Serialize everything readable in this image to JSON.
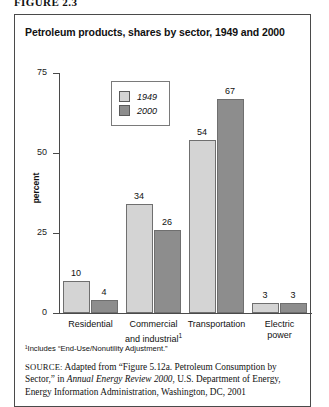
{
  "figure_label": "FIGURE 2.3",
  "chart_title": "Petroleum products, shares by sector, 1949 and 2000",
  "footnote": "¹Includes “End-Use/Nonutility Adjustment.”",
  "source": {
    "prefix": "SOURCE:",
    "part1": " Adapted from “Figure 5.12a. Petroleum Consumption by Sector,” in ",
    "italic": "Annual Energy Review 2000",
    "part2": ", U.S. Department of Energy, Energy Information Administration, Washington, DC, 2001"
  },
  "colors": {
    "series_1949": "#d4d4d4",
    "series_2000": "#8d8d8d",
    "axis": "#4a4a4a",
    "border": "#4a4a4a",
    "text": "#111111"
  },
  "chart_data": {
    "type": "bar",
    "title": "Petroleum products, shares by sector, 1949 and 2000",
    "xlabel": "",
    "ylabel": "percent",
    "ylim": [
      0,
      75
    ],
    "yticks": [
      0,
      25,
      50,
      75
    ],
    "ytick_labels": [
      "0",
      "25",
      "50",
      "75"
    ],
    "grid": false,
    "legend_position": "upper-left-inside",
    "categories": [
      "Residential",
      "Commercial and industrial¹",
      "Transportation",
      "Electric power"
    ],
    "category_lines": [
      [
        "Residential"
      ],
      [
        "Commercial",
        "and industrial¹"
      ],
      [
        "Transportation"
      ],
      [
        "Electric",
        "power"
      ]
    ],
    "series": [
      {
        "name": "1949",
        "color": "#d4d4d4",
        "values": [
          10,
          34,
          54,
          3
        ]
      },
      {
        "name": "2000",
        "color": "#8d8d8d",
        "values": [
          4,
          26,
          67,
          3
        ]
      }
    ]
  }
}
